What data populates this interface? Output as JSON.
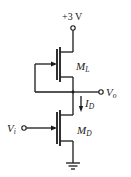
{
  "diagram": {
    "type": "circuit-schematic",
    "supply": {
      "label": "+3 V",
      "value": 3,
      "unit": "V"
    },
    "input": {
      "label_main": "V",
      "label_sub": "i"
    },
    "output": {
      "label_main": "V",
      "label_sub": "o"
    },
    "current": {
      "label_main": "I",
      "label_sub": "D",
      "direction": "down"
    },
    "transistors": [
      {
        "id": "load",
        "label_main": "M",
        "label_sub": "L",
        "type": "NMOS",
        "connection": "diode-connected (gate tied to source/output node)"
      },
      {
        "id": "driver",
        "label_main": "M",
        "label_sub": "D",
        "type": "NMOS",
        "connection": "gate driven by V_i, source to ground"
      }
    ],
    "ground": {
      "label": "ground"
    },
    "colors": {
      "line": "#1a1a1a",
      "background": "#ffffff"
    }
  }
}
